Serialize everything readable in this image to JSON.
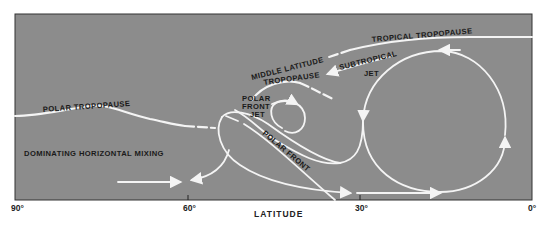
{
  "diagram": {
    "panel_color": "#8c8c8c",
    "line_color": "#f4f4f4",
    "text_color": "#1a1a1a",
    "labels": {
      "tropical_tropopause": "TROPICAL TROPOPAUSE",
      "subtropical": "SUBTROPICAL",
      "jet": "JET",
      "middle_latitude": "MIDDLE LATITUDE",
      "tropopause": "TROPOPAUSE",
      "polar_tropopause": "POLAR  TROPOPAUSE",
      "polar": "POLAR",
      "front": "FRONT",
      "front_jet": "JET",
      "polar_front": "POLAR FRONT",
      "horizontal_mixing": "DOMINATING HORIZONTAL MIXING"
    },
    "x_axis": {
      "title": "LATITUDE",
      "ticks": [
        "90°",
        "60°",
        "30°",
        "0°"
      ]
    }
  }
}
